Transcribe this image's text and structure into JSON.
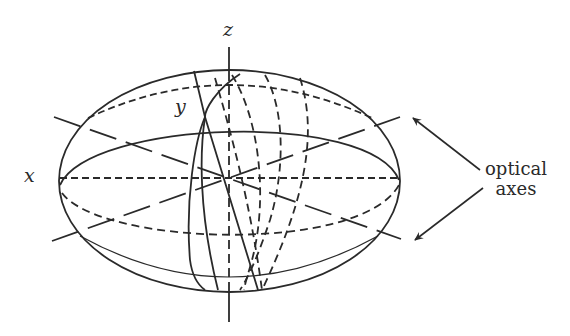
{
  "figure": {
    "labels": {
      "z": "z",
      "y": "y",
      "x": "x",
      "annotation_line1": "optical",
      "annotation_line2": "axes"
    },
    "colors": {
      "ink": "#2a2a2a",
      "background": "#ffffff"
    }
  }
}
